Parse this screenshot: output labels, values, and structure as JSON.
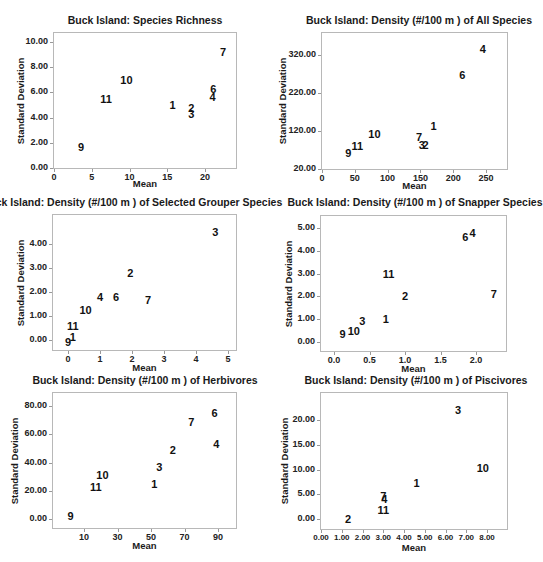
{
  "chart_data": [
    {
      "type": "scatter",
      "title": "Buck Island: Species Richness",
      "xlabel": "Mean",
      "ylabel": "Standard Deviation",
      "xticks": [
        "0",
        "5",
        "10",
        "15",
        "20"
      ],
      "yticks": [
        "0.00",
        "2.00",
        "4.00",
        "6.00",
        "8.00",
        "10.00"
      ],
      "xlim": [
        0,
        24
      ],
      "ylim": [
        0,
        10.5
      ],
      "grid": false,
      "points": [
        {
          "label": "1",
          "x": 15.7,
          "y": 5.0
        },
        {
          "label": "2",
          "x": 18.2,
          "y": 4.8
        },
        {
          "label": "3",
          "x": 18.2,
          "y": 4.3
        },
        {
          "label": "4",
          "x": 21.0,
          "y": 5.6
        },
        {
          "label": "6",
          "x": 21.1,
          "y": 6.3
        },
        {
          "label": "7",
          "x": 22.4,
          "y": 9.2
        },
        {
          "label": "9",
          "x": 3.6,
          "y": 1.7
        },
        {
          "label": "10",
          "x": 9.6,
          "y": 7.0
        },
        {
          "label": "11",
          "x": 6.9,
          "y": 5.5
        }
      ]
    },
    {
      "type": "scatter",
      "title": "Buck Island: Density (#/100 m ) of All Species",
      "xlabel": "Mean",
      "ylabel": "Standard Deviation",
      "xticks": [
        "0",
        "50",
        "100",
        "150",
        "200",
        "250"
      ],
      "yticks": [
        "20.00",
        "120.00",
        "220.00",
        "320.00"
      ],
      "xlim": [
        0,
        280
      ],
      "ylim": [
        20,
        360
      ],
      "grid": false,
      "points": [
        {
          "label": "1",
          "x": 170,
          "y": 132
        },
        {
          "label": "2",
          "x": 158,
          "y": 83
        },
        {
          "label": "3",
          "x": 152,
          "y": 83
        },
        {
          "label": "4",
          "x": 245,
          "y": 336
        },
        {
          "label": "6",
          "x": 214,
          "y": 268
        },
        {
          "label": "7",
          "x": 148,
          "y": 105
        },
        {
          "label": "9",
          "x": 40,
          "y": 62
        },
        {
          "label": "10",
          "x": 80,
          "y": 113
        },
        {
          "label": "11",
          "x": 54,
          "y": 80
        }
      ]
    },
    {
      "type": "scatter",
      "title": "Buck Island: Density (#/100 m ) of Selected Grouper Species",
      "xlabel": "Mean",
      "ylabel": "Standard Deviation",
      "xticks": [
        "0",
        "1",
        "2",
        "3",
        "4",
        "5"
      ],
      "yticks": [
        "0.00",
        "1.00",
        "2.00",
        "3.00",
        "4.00"
      ],
      "xlim": [
        -0.5,
        5.3
      ],
      "ylim": [
        -0.45,
        5.2
      ],
      "grid": false,
      "points": [
        {
          "label": "1",
          "x": 0.15,
          "y": 0.12
        },
        {
          "label": "2",
          "x": 1.95,
          "y": 2.8
        },
        {
          "label": "3",
          "x": 4.6,
          "y": 4.5
        },
        {
          "label": "4",
          "x": 1.0,
          "y": 1.8
        },
        {
          "label": "6",
          "x": 1.5,
          "y": 1.8
        },
        {
          "label": "7",
          "x": 2.5,
          "y": 1.65
        },
        {
          "label": "9",
          "x": 0.0,
          "y": -0.1
        },
        {
          "label": "10",
          "x": 0.55,
          "y": 1.25
        },
        {
          "label": "11",
          "x": 0.15,
          "y": 0.6
        }
      ]
    },
    {
      "type": "scatter",
      "title": "Buck Island: Density (#/100 m ) of Snapper Species",
      "xlabel": "Mean",
      "ylabel": "Standard Deviation",
      "xticks": [
        "0.0",
        "0.5",
        "1.0",
        "1.5",
        "2.0"
      ],
      "yticks": [
        "0.00",
        "1.00",
        "2.00",
        "3.00",
        "4.00",
        "5.00"
      ],
      "xlim": [
        -0.2,
        2.4
      ],
      "ylim": [
        -0.45,
        5.5
      ],
      "grid": false,
      "points": [
        {
          "label": "1",
          "x": 0.73,
          "y": 1.0
        },
        {
          "label": "2",
          "x": 1.0,
          "y": 2.0
        },
        {
          "label": "3",
          "x": 0.4,
          "y": 0.9
        },
        {
          "label": "4",
          "x": 1.95,
          "y": 4.8
        },
        {
          "label": "6",
          "x": 1.85,
          "y": 4.6
        },
        {
          "label": "7",
          "x": 2.25,
          "y": 2.1
        },
        {
          "label": "9",
          "x": 0.12,
          "y": 0.35
        },
        {
          "label": "10",
          "x": 0.28,
          "y": 0.5
        },
        {
          "label": "11",
          "x": 0.77,
          "y": 3.0
        }
      ]
    },
    {
      "type": "scatter",
      "title": "Buck Island: Density (#/100 m ) of Herbivores",
      "xlabel": "Mean",
      "ylabel": "Standard Deviation",
      "xticks": [
        "10",
        "30",
        "50",
        "70",
        "90"
      ],
      "yticks": [
        "0.00",
        "20.00",
        "40.00",
        "60.00",
        "80.00"
      ],
      "xlim": [
        -10,
        100
      ],
      "ylim": [
        -7,
        90
      ],
      "grid": false,
      "points": [
        {
          "label": "1",
          "x": 52,
          "y": 25
        },
        {
          "label": "2",
          "x": 63,
          "y": 49
        },
        {
          "label": "3",
          "x": 55,
          "y": 37
        },
        {
          "label": "4",
          "x": 89,
          "y": 53
        },
        {
          "label": "6",
          "x": 88,
          "y": 75
        },
        {
          "label": "7",
          "x": 74,
          "y": 69
        },
        {
          "label": "9",
          "x": 2,
          "y": 2
        },
        {
          "label": "10",
          "x": 21,
          "y": 31
        },
        {
          "label": "11",
          "x": 17,
          "y": 23
        }
      ]
    },
    {
      "type": "scatter",
      "title": "Buck Island: Density (#/100 m ) of Piscivores",
      "xlabel": "Mean",
      "ylabel": "Standard Deviation",
      "xticks": [
        "0.00",
        "1.00",
        "2.00",
        "3.00",
        "4.00",
        "5.00",
        "6.00",
        "7.00",
        "8.00"
      ],
      "yticks": [
        "0.00",
        "5.00",
        "10.00",
        "15.00",
        "20.00"
      ],
      "xlim": [
        0,
        9
      ],
      "ylim": [
        -2,
        25
      ],
      "grid": false,
      "points": [
        {
          "label": "1",
          "x": 4.6,
          "y": 7.3
        },
        {
          "label": "2",
          "x": 1.3,
          "y": 0.0
        },
        {
          "label": "3",
          "x": 6.6,
          "y": 22.0
        },
        {
          "label": "4",
          "x": 3.05,
          "y": 4.1
        },
        {
          "label": "7",
          "x": 3.0,
          "y": 4.6
        },
        {
          "label": "10",
          "x": 7.8,
          "y": 10.3
        },
        {
          "label": "11",
          "x": 3.0,
          "y": 1.9
        }
      ]
    }
  ],
  "charts": {
    "c0": {
      "title": "Buck Island: Species Richness",
      "xlabel": "Mean",
      "ylabel": "Standard Deviation"
    },
    "c1": {
      "title": "Buck Island: Density (#/100 m ) of All Species",
      "xlabel": "Mean",
      "ylabel": "Standard Deviation"
    },
    "c2": {
      "title": "Buck Island: Density (#/100 m ) of Selected Grouper Species",
      "xlabel": "Mean",
      "ylabel": "Standard Deviation"
    },
    "c3": {
      "title": "Buck Island: Density (#/100 m ) of Snapper Species",
      "xlabel": "Mean",
      "ylabel": "Standard Deviation"
    },
    "c4": {
      "title": "Buck Island: Density (#/100 m ) of Herbivores",
      "xlabel": "Mean",
      "ylabel": "Standard Deviation"
    },
    "c5": {
      "title": "Buck Island: Density (#/100 m ) of Piscivores",
      "xlabel": "Mean",
      "ylabel": "Standard Deviation"
    }
  }
}
